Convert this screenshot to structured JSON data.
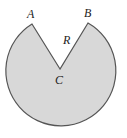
{
  "diagram": {
    "type": "circle-with-sector-removed",
    "colors": {
      "fill": "#d8d8d8",
      "stroke": "#555555",
      "background": "#ffffff"
    },
    "circle": {
      "cx": 60,
      "cy": 71,
      "r": 55
    },
    "points": {
      "A": {
        "label": "A",
        "x": 32,
        "y": 24
      },
      "B": {
        "label": "B",
        "x": 88,
        "y": 23
      },
      "C": {
        "label": "C",
        "x": 60,
        "y": 69
      }
    },
    "radius_label": "R"
  }
}
